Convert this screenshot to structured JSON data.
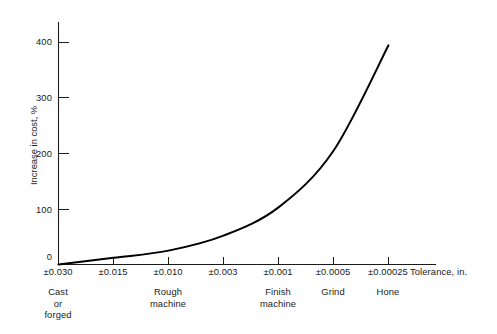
{
  "chart_data": {
    "type": "line",
    "title": "",
    "xlabel": "Tolerance, in.",
    "ylabel": "Increase in cost, %",
    "grid": false,
    "legend": "none",
    "ylim": [
      0,
      440
    ],
    "yticks": [
      0,
      100,
      200,
      300,
      400
    ],
    "ytick_labels": [
      "0",
      "100",
      "200",
      "300",
      "400"
    ],
    "categories": [
      "±0.030",
      "±0.015",
      "±0.010",
      "±0.003",
      "±0.001",
      "±0.0005",
      "±0.00025"
    ],
    "values": [
      0,
      12,
      25,
      52,
      103,
      205,
      395
    ],
    "series": [
      {
        "name": "Increase in cost",
        "values": [
          0,
          12,
          25,
          52,
          103,
          205,
          395
        ]
      }
    ],
    "process_groups": [
      {
        "label": "Cast\nor\nforged",
        "lines": [
          "Cast",
          "or",
          "forged"
        ],
        "at_category": "±0.030"
      },
      {
        "label": "Rough\nmachine",
        "lines": [
          "Rough",
          "machine"
        ],
        "at_category": "±0.010"
      },
      {
        "label": "Finish\nmachine",
        "lines": [
          "Finish",
          "machine"
        ],
        "at_category": "±0.001"
      },
      {
        "label": "Grind",
        "lines": [
          "Grind"
        ],
        "at_category": "±0.0005"
      },
      {
        "label": "Hone",
        "lines": [
          "Hone"
        ],
        "at_category": "±0.00025"
      }
    ],
    "colors": {
      "curve": "#000000",
      "axis": "#1a1a1a",
      "background": "#ffffff",
      "text": "#1a1a1a"
    }
  },
  "axes": {
    "y_title": "Increase in cost, %",
    "x_title": "Tolerance, in.",
    "y_labels": {
      "t400": "400",
      "t300": "300",
      "t200": "200",
      "t100": "100",
      "t0": "0"
    },
    "x_labels": {
      "t0": "±0.030",
      "t1": "±0.015",
      "t2": "±0.010",
      "t3": "±0.003",
      "t4": "±0.001",
      "t5": "±0.0005",
      "t6": "±0.00025"
    }
  },
  "process_labels": {
    "cast_l1": "Cast",
    "cast_l2": "or",
    "cast_l3": "forged",
    "rough_l1": "Rough",
    "rough_l2": "machine",
    "finish_l1": "Finish",
    "finish_l2": "machine",
    "grind_l1": "Grind",
    "hone_l1": "Hone"
  }
}
